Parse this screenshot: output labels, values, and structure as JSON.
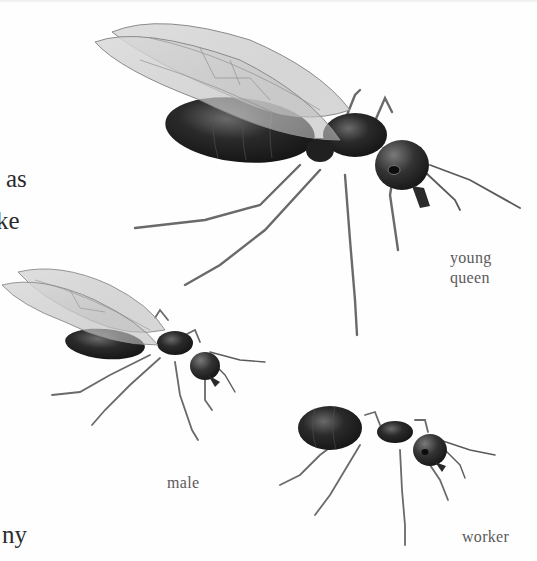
{
  "page": {
    "background": "#fefefe",
    "text_color": "#2b2b2b",
    "caption_color": "#5a5a5a"
  },
  "body_text": {
    "fragments": [
      "as",
      "ke",
      "ny"
    ]
  },
  "illustrations": [
    {
      "id": "young-queen",
      "caption_lines": [
        "young",
        "queen"
      ],
      "winged": true
    },
    {
      "id": "male",
      "caption_lines": [
        "male"
      ],
      "winged": true
    },
    {
      "id": "worker",
      "caption_lines": [
        "worker"
      ],
      "winged": false
    }
  ]
}
